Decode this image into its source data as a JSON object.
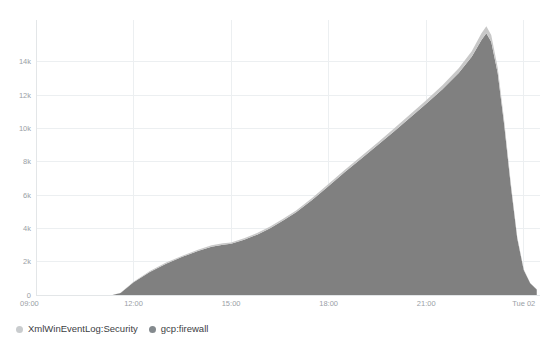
{
  "chart_data": {
    "type": "area",
    "stacked": true,
    "title": "",
    "subtitle": "",
    "xlabel": "",
    "ylabel": "",
    "grid": true,
    "legend_position": "bottom-left",
    "ylim": [
      0,
      16500
    ],
    "ytick_labels": [
      "0",
      "2k",
      "4k",
      "6k",
      "8k",
      "10k",
      "12k",
      "14k"
    ],
    "ytick_values": [
      0,
      2000,
      4000,
      6000,
      8000,
      10000,
      12000,
      14000
    ],
    "xtick_labels": [
      "09:00",
      "12:00",
      "15:00",
      "18:00",
      "21:00",
      "Tue 02"
    ],
    "xtick_values": [
      9.0,
      12.0,
      15.0,
      18.0,
      21.0,
      24.0
    ],
    "xlim": [
      9.0,
      24.5
    ],
    "x": [
      9.0,
      9.5,
      10.0,
      10.5,
      11.0,
      11.35,
      11.6,
      12.0,
      12.5,
      13.0,
      13.5,
      14.0,
      14.4,
      14.75,
      15.0,
      15.4,
      15.8,
      16.2,
      16.6,
      17.0,
      17.5,
      18.0,
      18.5,
      19.0,
      19.5,
      20.0,
      20.5,
      21.0,
      21.5,
      22.0,
      22.4,
      22.7,
      22.85,
      23.0,
      23.2,
      23.4,
      23.6,
      23.8,
      24.0,
      24.2,
      24.4
    ],
    "series": [
      {
        "name": "gcp:firewall",
        "color": "#808080",
        "values": [
          0,
          0,
          0,
          0,
          0,
          0,
          120,
          760,
          1380,
          1880,
          2290,
          2650,
          2900,
          3020,
          3070,
          3320,
          3620,
          4010,
          4470,
          4960,
          5720,
          6540,
          7380,
          8180,
          8980,
          9800,
          10640,
          11480,
          12340,
          13320,
          14300,
          15300,
          15700,
          15200,
          13300,
          10200,
          6600,
          3400,
          1500,
          700,
          330
        ]
      },
      {
        "name": "XmlWinEventLog:Security",
        "color": "#c8c8c8",
        "values": [
          0,
          0,
          0,
          0,
          0,
          0,
          10,
          40,
          55,
          65,
          70,
          75,
          80,
          85,
          85,
          90,
          95,
          100,
          105,
          110,
          120,
          130,
          140,
          150,
          160,
          175,
          190,
          210,
          240,
          280,
          330,
          400,
          430,
          400,
          330,
          250,
          160,
          90,
          40,
          20,
          10
        ]
      }
    ]
  },
  "legend": {
    "items": [
      {
        "label": "XmlWinEventLog:Security",
        "color": "#c9ccce"
      },
      {
        "label": "gcp:firewall",
        "color": "#848a8e"
      }
    ]
  }
}
